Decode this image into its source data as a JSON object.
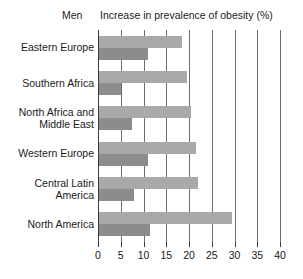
{
  "chart_data": {
    "type": "bar",
    "orientation": "horizontal",
    "title": "Increase in prevalence of obesity (%)",
    "series_label": "Men",
    "xlabel": "Increase in prevalence of obesity (%)",
    "ylabel": "",
    "xlim": [
      0,
      40
    ],
    "xticks": [
      0,
      5,
      10,
      15,
      20,
      25,
      30,
      35,
      40
    ],
    "xtick_labels": [
      "0",
      "5",
      "10",
      "15",
      "20",
      "25",
      "30",
      "35",
      "40"
    ],
    "grid": true,
    "grid_axis": "x",
    "legend": "none",
    "categories": [
      "Eastern Europe",
      "Southern Africa",
      "North Africa and Middle East",
      "Western Europe",
      "Central Latin America",
      "North America"
    ],
    "category_labels": [
      [
        "Eastern Europe"
      ],
      [
        "Southern Africa"
      ],
      [
        "North Africa and",
        "Middle East"
      ],
      [
        "Western Europe"
      ],
      [
        "Central Latin",
        "America"
      ],
      [
        "North America"
      ]
    ],
    "series": [
      {
        "name": "upper",
        "color": "#a9a9a9",
        "values": [
          18.5,
          19.5,
          20.5,
          21.5,
          22.0,
          29.5
        ]
      },
      {
        "name": "lower",
        "color": "#8c8c8c",
        "values": [
          11.0,
          5.0,
          7.5,
          11.0,
          8.0,
          11.5
        ]
      }
    ]
  },
  "colors": {
    "bar_light": "#a9a9a9",
    "bar_dark": "#8c8c8c",
    "gridline": "#6d6d6d",
    "axis": "#3a3a3a",
    "text": "#1a1a1a",
    "background": "#ffffff"
  }
}
